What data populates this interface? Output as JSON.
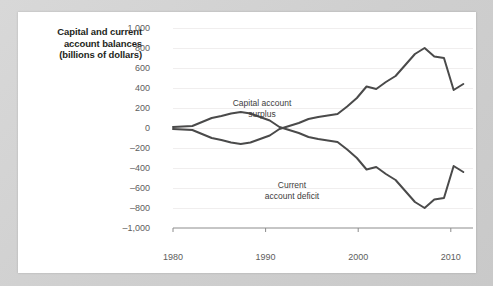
{
  "chart_data": {
    "type": "line",
    "title": "Capital and current account balances (billions of dollars)",
    "title_lines": [
      "Capital and current",
      "account balances",
      "(billions of dollars)"
    ],
    "xlabel": "",
    "ylabel": "Capital and current account balances (billions of dollars)",
    "xlim": [
      1980,
      2011
    ],
    "ylim": [
      -1000,
      1000
    ],
    "ytick_labels": [
      "1,000",
      "800",
      "600",
      "400",
      "200",
      "0",
      "–200",
      "–400",
      "–600",
      "–800",
      "–1,000"
    ],
    "ytick_values": [
      1000,
      800,
      600,
      400,
      200,
      0,
      -200,
      -400,
      -600,
      -800,
      -1000
    ],
    "xtick_labels": [
      "1980",
      "1990",
      "2000",
      "2010"
    ],
    "xtick_values": [
      1980,
      1990,
      2000,
      2010
    ],
    "grid": true,
    "legend_position": "inline-annotations",
    "line_color": "#4a4a4a",
    "grid_color": "#f0eeee",
    "axis_color": "#8c8c8c",
    "annotations": [
      {
        "name": "capital-account-surplus",
        "lines": [
          "Capital account",
          "surplus"
        ],
        "text": "Capital account surplus"
      },
      {
        "name": "current-account-deficit",
        "lines": [
          "Current",
          "account deficit"
        ],
        "text": "Current account deficit"
      }
    ],
    "x": [
      1980,
      1981,
      1982,
      1983,
      1984,
      1985,
      1986,
      1987,
      1988,
      1989,
      1990,
      1991,
      1992,
      1993,
      1994,
      1995,
      1996,
      1997,
      1998,
      1999,
      2000,
      2001,
      2002,
      2003,
      2004,
      2005,
      2006,
      2007,
      2008,
      2009,
      2010
    ],
    "series": [
      {
        "name": "Capital account surplus",
        "values": [
          10,
          15,
          20,
          60,
          100,
          120,
          145,
          160,
          145,
          110,
          75,
          10,
          -20,
          -50,
          -90,
          -110,
          -125,
          -140,
          -215,
          -300,
          -415,
          -390,
          -460,
          -520,
          -630,
          -740,
          -800,
          -715,
          -700,
          -380,
          -440
        ]
      },
      {
        "name": "Current account deficit",
        "values": [
          -10,
          -15,
          -20,
          -60,
          -100,
          -120,
          -145,
          -160,
          -145,
          -110,
          -75,
          -10,
          20,
          50,
          90,
          110,
          125,
          140,
          215,
          300,
          415,
          390,
          460,
          520,
          630,
          740,
          800,
          715,
          700,
          380,
          440
        ]
      }
    ],
    "note": "The upper plotted curve is the capital account surplus (positive after ~1992); the lower mirrored curve is the current account deficit."
  }
}
